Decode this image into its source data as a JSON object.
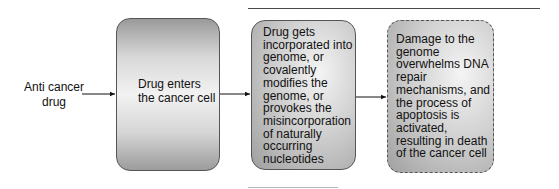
{
  "diagram": {
    "input_label": "Anti cancer drug",
    "steps": [
      {
        "id": "step1",
        "text": "Drug enters the cancer cell",
        "border": "solid"
      },
      {
        "id": "step2",
        "text": "Drug gets incorporated into genome, or covalently modifies the genome, or provokes the misincorporation of naturally occurring nucleotides",
        "border": "solid"
      },
      {
        "id": "step3",
        "text": "Damage to the genome overwhelms DNA repair mechanisms, and the process of apoptosis is activated, resulting in death of the cancer cell",
        "border": "dashed"
      }
    ],
    "edges": [
      {
        "from": "input",
        "to": "step1"
      },
      {
        "from": "step1",
        "to": "step2"
      },
      {
        "from": "step2",
        "to": "step3"
      }
    ]
  }
}
